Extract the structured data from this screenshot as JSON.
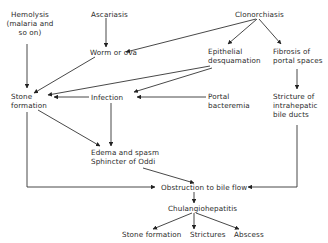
{
  "diagram": {
    "type": "flowchart",
    "title": "",
    "line_color": "#333333",
    "text_color": "#2a2a2a",
    "nodes": {
      "hemolysis": {
        "line1": "Hemolysis",
        "line2": "(malaria and",
        "line3": "so on)"
      },
      "ascariasis": {
        "label": "Ascariasis"
      },
      "clonorchiasis": {
        "label": "Clonorchiasis"
      },
      "worm_or_ova": {
        "label": "Worm or ova"
      },
      "epithelial": {
        "line1": "Epithelial",
        "line2": "desquamation"
      },
      "fibrosis": {
        "line1": "Fibrosis of",
        "line2": "portal spaces"
      },
      "stone_formation_top": {
        "line1": "Stone",
        "line2": "formation"
      },
      "infection": {
        "label": "Infection"
      },
      "portal_bacteremia": {
        "line1": "Portal",
        "line2": "bacteremia"
      },
      "stricture_intrahepatic": {
        "line1": "Stricture of",
        "line2": "intrahepatic",
        "line3": "bile ducts"
      },
      "edema_spasm": {
        "line1": "Edema and spasm",
        "line2": "Sphincter of Oddi"
      },
      "obstruction": {
        "label": "Obstruction to bile flow"
      },
      "cholangiohepatitis": {
        "label": "Chulangiohepatitis"
      },
      "stone_formation_bottom": {
        "label": "Stone formation"
      },
      "strictures": {
        "label": "Strictures"
      },
      "abscess": {
        "label": "Abscess"
      }
    },
    "edges": [
      {
        "from": "ascariasis",
        "to": "worm_or_ova"
      },
      {
        "from": "clonorchiasis",
        "to": "worm_or_ova"
      },
      {
        "from": "clonorchiasis",
        "to": "epithelial"
      },
      {
        "from": "clonorchiasis",
        "to": "fibrosis"
      },
      {
        "from": "hemolysis",
        "to": "stone_formation_top"
      },
      {
        "from": "worm_or_ova",
        "to": "stone_formation_top"
      },
      {
        "from": "epithelial",
        "to": "stone_formation_top"
      },
      {
        "from": "epithelial",
        "to": "infection"
      },
      {
        "from": "infection",
        "to": "stone_formation_top"
      },
      {
        "from": "portal_bacteremia",
        "to": "infection"
      },
      {
        "from": "fibrosis",
        "to": "stricture_intrahepatic"
      },
      {
        "from": "infection",
        "to": "edema_spasm"
      },
      {
        "from": "stone_formation_top",
        "to": "edema_spasm"
      },
      {
        "from": "stone_formation_top",
        "to": "obstruction"
      },
      {
        "from": "edema_spasm",
        "to": "obstruction"
      },
      {
        "from": "stricture_intrahepatic",
        "to": "obstruction"
      },
      {
        "from": "obstruction",
        "to": "cholangiohepatitis"
      },
      {
        "from": "cholangiohepatitis",
        "to": "stone_formation_bottom"
      },
      {
        "from": "cholangiohepatitis",
        "to": "strictures"
      },
      {
        "from": "cholangiohepatitis",
        "to": "abscess"
      }
    ]
  }
}
